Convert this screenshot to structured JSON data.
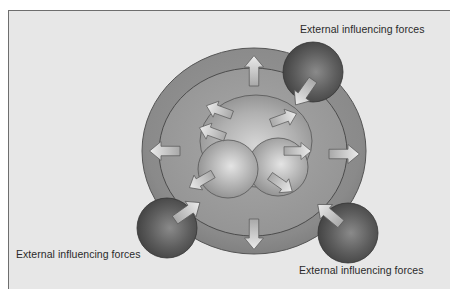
{
  "diagram": {
    "type": "concentric-spheres-influence",
    "labels": {
      "top_right": "External influencing forces",
      "bottom_left": "External influencing forces",
      "bottom_right": "External influencing forces"
    },
    "layers": [
      {
        "name": "outer-ring"
      },
      {
        "name": "inner-ring"
      },
      {
        "name": "core-back-sphere"
      },
      {
        "name": "core-left-sphere"
      },
      {
        "name": "core-right-sphere"
      }
    ],
    "external_forces": [
      {
        "position": "top-right",
        "arrow": "inward"
      },
      {
        "position": "bottom-left",
        "arrow": "inward"
      },
      {
        "position": "bottom-right",
        "arrow": "inward"
      }
    ],
    "internal_arrows": {
      "outward_from_rings": [
        "up",
        "down",
        "left",
        "right"
      ],
      "outward_from_core": [
        "upper-left",
        "upper-right",
        "left",
        "right",
        "lower-left",
        "lower-right"
      ]
    },
    "colors": {
      "background": "#e7e7e7",
      "outer_ring": "#8a8a8a",
      "inner_ring": "#9c9c9c",
      "core": "#b0b0b0",
      "external_ball": "#5a5a5a",
      "arrow_fill": "#d8d8d8",
      "text": "#2a2a2a"
    }
  }
}
